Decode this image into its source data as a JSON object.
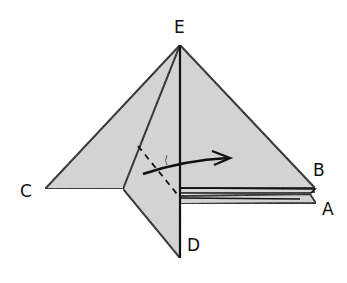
{
  "diagram": {
    "type": "origami-fold-step",
    "colors": {
      "paper": "#d6d6d6",
      "outline": "#111111",
      "background": "#ffffff"
    },
    "points": {
      "E": {
        "label": "E",
        "x": 180,
        "y": 45,
        "label_x": 180,
        "label_y": 33
      },
      "C": {
        "label": "C",
        "x": 45,
        "y": 189,
        "label_x": 27,
        "label_y": 197
      },
      "D": {
        "label": "D",
        "x": 180,
        "y": 258,
        "label_x": 194,
        "label_y": 251
      },
      "B": {
        "label": "B",
        "x": 315,
        "y": 190,
        "label_x": 318,
        "label_y": 176
      },
      "A": {
        "label": "A",
        "x": 316,
        "y": 203,
        "label_x": 329,
        "label_y": 215
      }
    },
    "annotations": {
      "dashed_fold_line": "valley fold line on front flap",
      "arrow": "fold direction to the right"
    }
  }
}
